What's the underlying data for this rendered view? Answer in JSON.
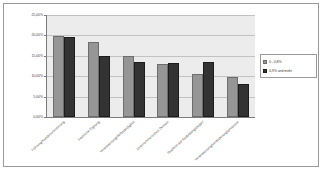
{
  "chart_data": {
    "type": "bar",
    "title": "",
    "xlabel": "",
    "ylabel": "",
    "ylim": [
      0,
      25
    ],
    "ytick_labels": [
      "25,00%",
      "20,00%",
      "15,00%",
      "10,00%",
      "5,00%",
      "0,00%"
    ],
    "ytick_values": [
      25,
      20,
      15,
      10,
      5,
      0
    ],
    "grid": true,
    "legend_position": "right",
    "categories": [
      "Führung/Kundenorientierung",
      "Fachliche Eignung",
      "Verantwortung/Selbständigkeit",
      "Unternehmerisches Denken",
      "Reaktion auf Ausbildungsbedarf",
      "Verantwortung/Veränderungsprozesse"
    ],
    "series": [
      {
        "name": "0 - 0,8%",
        "color": "#969696",
        "values": [
          19.8,
          18.4,
          14.9,
          13.1,
          10.6,
          9.8
        ]
      },
      {
        "name": "0,9% und mehr",
        "color": "#333333",
        "values": [
          19.7,
          14.9,
          13.4,
          13.2,
          13.4,
          8.0
        ]
      }
    ]
  },
  "legend": {
    "items": [
      {
        "label": "0 - 0,8%"
      },
      {
        "label": "0,9% und mehr"
      }
    ]
  }
}
